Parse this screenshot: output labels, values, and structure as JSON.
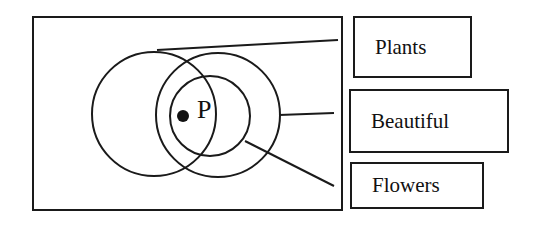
{
  "diagram": {
    "type": "venn",
    "point_label": "P",
    "sets": [
      {
        "id": "plants",
        "label": "Plants",
        "circle": {
          "cx": 154,
          "cy": 114,
          "r": 62
        }
      },
      {
        "id": "beautiful",
        "label": "Beautiful",
        "circle": {
          "cx": 218,
          "cy": 115,
          "r": 62
        }
      },
      {
        "id": "flowers",
        "label": "Flowers",
        "circle": {
          "cx": 210,
          "cy": 116,
          "r": 40
        }
      }
    ],
    "stroke_color": "#1a1a1a"
  }
}
